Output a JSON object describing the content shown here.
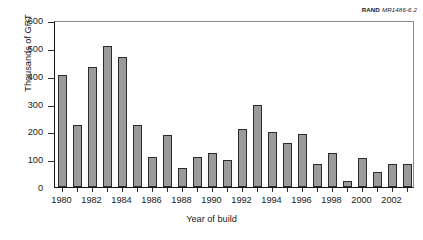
{
  "figure": {
    "source_tag_brand": "RAND",
    "source_tag_number": "MR1486-6.2"
  },
  "chart_data": {
    "type": "bar",
    "title": "",
    "xlabel": "Year of build",
    "ylabel": "Thousands of GRT",
    "categories": [
      "1980",
      "1981",
      "1982",
      "1983",
      "1984",
      "1985",
      "1986",
      "1987",
      "1988",
      "1989",
      "1990",
      "1991",
      "1992",
      "1993",
      "1994",
      "1995",
      "1996",
      "1997",
      "1998",
      "1999",
      "2000",
      "2001",
      "2002",
      "2003"
    ],
    "values": [
      404,
      222,
      430,
      508,
      467,
      222,
      108,
      188,
      68,
      107,
      121,
      98,
      207,
      293,
      198,
      159,
      192,
      82,
      124,
      22,
      106,
      53,
      82,
      82
    ],
    "ylim": [
      0,
      600
    ],
    "yticks": [
      0,
      100,
      200,
      300,
      400,
      500,
      600
    ],
    "yticklabels": [
      "0",
      "100",
      "200",
      "300",
      "400",
      "500",
      "600"
    ],
    "xtick_categories": [
      "1980",
      "1982",
      "1984",
      "1986",
      "1988",
      "1990",
      "1992",
      "1994",
      "1996",
      "1998",
      "2000",
      "2002"
    ],
    "grid": false,
    "legend": null,
    "bar_fill_color": "#9b9b9b",
    "bar_edge_color": "#2b2b2b"
  }
}
